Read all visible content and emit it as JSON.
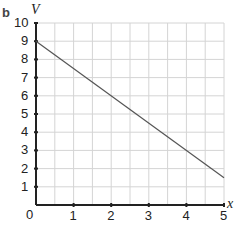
{
  "panel_label": "b",
  "chart_data": {
    "type": "line",
    "title": "",
    "xlabel": "x",
    "ylabel": "V",
    "xlim": [
      0,
      5
    ],
    "ylim": [
      0,
      10
    ],
    "x_ticks": [
      "0",
      "1",
      "2",
      "3",
      "4",
      "5"
    ],
    "y_ticks": [
      "1",
      "2",
      "3",
      "4",
      "5",
      "6",
      "7",
      "8",
      "9",
      "10"
    ],
    "grid": true,
    "grid_x_step": 0.5,
    "grid_y_step": 1,
    "series": [
      {
        "name": "V",
        "x": [
          0,
          5
        ],
        "values": [
          9,
          1.5
        ],
        "color": "#555555"
      }
    ]
  },
  "axis": {
    "x_label": "x",
    "y_label": "V",
    "origin_label": "0",
    "x_tick_labels": [
      "1",
      "2",
      "3",
      "4",
      "5"
    ],
    "y_tick_labels": [
      "1",
      "2",
      "3",
      "4",
      "5",
      "6",
      "7",
      "8",
      "9",
      "10"
    ]
  }
}
